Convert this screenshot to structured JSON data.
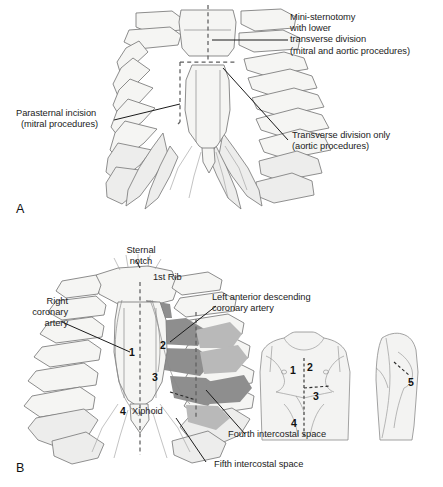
{
  "figure": {
    "panels": [
      {
        "letter": "A",
        "labels": [
          {
            "name": "mini-sternotomy-label",
            "lines": [
              "Mini-sternotomy",
              "with lower",
              "transverse division",
              "(mitral and aortic procedures)"
            ]
          },
          {
            "name": "parasternal-incision-label",
            "lines": [
              "Parasternal incision",
              "(mitral procedures)"
            ]
          },
          {
            "name": "transverse-division-label",
            "lines": [
              "Transverse division only",
              "(aortic procedures)"
            ]
          }
        ]
      },
      {
        "letter": "B",
        "labels": [
          {
            "name": "sternal-notch-label",
            "lines": [
              "Sternal",
              "notch"
            ]
          },
          {
            "name": "first-rib-label",
            "lines": [
              "1st Rib"
            ]
          },
          {
            "name": "right-coronary-artery-label",
            "lines": [
              "Right",
              "coronary",
              "artery"
            ]
          },
          {
            "name": "lad-coronary-artery-label",
            "lines": [
              "Left anterior descending",
              "coronary artery"
            ]
          },
          {
            "name": "xiphoid-label",
            "lines": [
              "Xiphoid"
            ]
          },
          {
            "name": "fourth-intercostal-space-label",
            "lines": [
              "Fourth intercostal space"
            ]
          },
          {
            "name": "fifth-intercostal-space-label",
            "lines": [
              "Fifth intercostal space"
            ]
          }
        ],
        "incision_numbers": [
          "1",
          "2",
          "3",
          "4",
          "5"
        ],
        "torso_front_numbers": [
          "1",
          "2",
          "3",
          "4"
        ],
        "torso_lateral_numbers": [
          "5"
        ]
      }
    ],
    "colors": {
      "outline": "#6f6f6f",
      "bone_fill": "#f4f4f2",
      "bone_fill_alt": "#ececeb",
      "shade_dark": "#8f8f8f",
      "shade_mid": "#b5b5b5",
      "skin_fill": "#f2f2f1",
      "leader_line": "#1b1b1b",
      "dashed_line": "#6a6a6a",
      "text": "#1b1b1b"
    }
  }
}
